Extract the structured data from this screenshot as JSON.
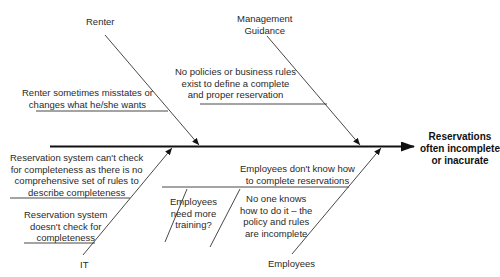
{
  "effect": {
    "line1": "Reservations",
    "line2": "often incomplete",
    "line3": "or inacurate"
  },
  "categories": {
    "renter": "Renter",
    "management": {
      "line1": "Management",
      "line2": "Guidance"
    },
    "it": "IT",
    "employees": "Employees"
  },
  "causes": {
    "renter_1": {
      "line1": "Renter sometimes misstates or",
      "line2": "changes what he/she wants"
    },
    "management_1": {
      "line1": "No policies or business rules",
      "line2": "exist to define a complete",
      "line3": "and proper reservation"
    },
    "it_1": {
      "line1": "Reservation system can't check",
      "line2": "for completeness as there is no",
      "line3": "comprehensive set of rules to",
      "line4": "describe completeness"
    },
    "it_2": {
      "line1": "Reservation system",
      "line2": "doesn't check for",
      "line3": "completeness"
    },
    "employees_1": {
      "line1": "Employees  don't know how",
      "line2": "to complete reservations"
    },
    "employees_1a": {
      "line1": "Employees",
      "line2": "need more",
      "line3": "training?"
    },
    "employees_1b": {
      "line1": "No one knows",
      "line2": "how to do it – the",
      "line3": "policy and rules",
      "line4": "are incomplete"
    }
  },
  "colors": {
    "line": "#222222",
    "spine": "#111111",
    "background": "#ffffff"
  }
}
